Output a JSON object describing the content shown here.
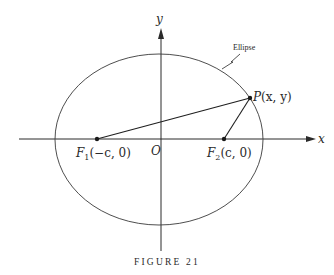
{
  "figure": {
    "caption": "FIGURE 21",
    "axes": {
      "x_label": "x",
      "y_label": "y",
      "origin_label": "O"
    },
    "curve": {
      "label": "Ellipse",
      "center": [
        159,
        139.5
      ],
      "rx": 104,
      "ry": 85.5
    },
    "points": {
      "F1": {
        "name": "F",
        "sub": "1",
        "coords": "(−c, 0)",
        "pos": [
          97,
          139
        ]
      },
      "F2": {
        "name": "F",
        "sub": "2",
        "coords": "(c, 0)",
        "pos": [
          224,
          139
        ]
      },
      "P": {
        "name": "P",
        "coords": "(x, y)",
        "pos": [
          250,
          98
        ]
      }
    },
    "segments": [
      {
        "from": "F1",
        "to": "P"
      },
      {
        "from": "F2",
        "to": "P"
      }
    ],
    "colors": {
      "ink": "#2a2a2a",
      "background": "#ffffff"
    }
  }
}
